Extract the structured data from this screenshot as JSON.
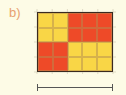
{
  "label": "b)",
  "colors": {
    "yellow": "#f9d646",
    "red": "#ee4a28",
    "background": "#fdfbe6",
    "border": "#3a2a20"
  },
  "grid": {
    "rows": 4,
    "cols": 5,
    "cells": [
      [
        "Y",
        "Y",
        "R",
        "R",
        "R"
      ],
      [
        "Y",
        "Y",
        "R",
        "R",
        "R"
      ],
      [
        "R",
        "R",
        "Y",
        "Y",
        "Y"
      ],
      [
        "R",
        "R",
        "Y",
        "Y",
        "Y"
      ]
    ]
  },
  "scale_bar": {
    "span_cols": 5
  }
}
